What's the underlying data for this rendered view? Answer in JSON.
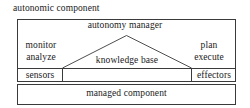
{
  "diagram": {
    "type": "block-architecture",
    "caption": "autonomic component",
    "outer_block": {
      "label": "autonomy manager",
      "left_column": {
        "line1": "monitor",
        "line2": "analyze"
      },
      "right_column": {
        "line1": "plan",
        "line2": "execute"
      },
      "center": "knowledge base",
      "interface_row": {
        "left": "sensors",
        "right": "effectors"
      }
    },
    "lower_block": {
      "label": "managed component"
    },
    "colors": {
      "stroke": "#3a3a3a",
      "background": "#ffffff",
      "text": "#1a1a1a"
    }
  }
}
